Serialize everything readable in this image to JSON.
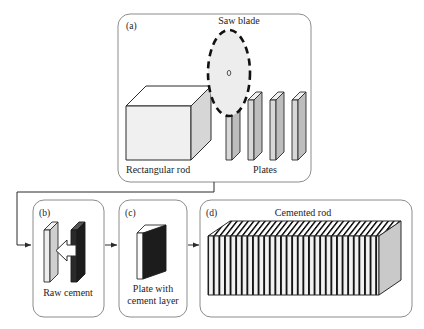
{
  "figure": {
    "background_color": "#ffffff",
    "line_color": "#7a7a7a",
    "ink_color": "#1d1d1d"
  },
  "panels": [
    {
      "id": "a",
      "label": "(a)",
      "title": "Saw blade",
      "labels": {
        "saw_blade": "Saw blade",
        "rectangular_rod": "Rectangular rod",
        "plates": "Plates"
      },
      "plate_count": 4,
      "colors": {
        "rod_front": "#f0f0f0",
        "rod_top": "#ffffff",
        "rod_side": "#d6d6d6",
        "plate_front": "#bdbdbd",
        "plate_top": "#efefef",
        "blade_fill": "#ededed",
        "blade_stroke": "#111111"
      }
    },
    {
      "id": "b",
      "label": "(b)",
      "labels": {
        "caption": "Raw cement"
      },
      "colors": {
        "plate_front": "#cfcfcf",
        "plate_top": "#f2f2f2",
        "cement_slab": "#1c1c1c",
        "arrow_fill": "#ffffff"
      }
    },
    {
      "id": "c",
      "label": "(c)",
      "labels": {
        "caption_line1": "Plate with",
        "caption_line2": "cement layer"
      },
      "colors": {
        "plate_front": "#1c1c1c",
        "plate_side": "#fbfbfb",
        "plate_top": "#ffffff"
      }
    },
    {
      "id": "d",
      "label": "(d)",
      "labels": {
        "caption": "Cemented rod"
      },
      "stripe_count": 26,
      "colors": {
        "front_base": "#f2f2f2",
        "stripe": "#151515",
        "top_base": "#ffffff",
        "end_face": "#c9c9c9"
      }
    }
  ],
  "connectors": [
    {
      "name": "a-to-b",
      "from": "a",
      "to": "b",
      "style": "elbow-arrow"
    },
    {
      "name": "b-to-c",
      "from": "b",
      "to": "c",
      "style": "straight-arrow"
    },
    {
      "name": "c-to-d",
      "from": "c",
      "to": "d",
      "style": "straight-arrow"
    }
  ]
}
